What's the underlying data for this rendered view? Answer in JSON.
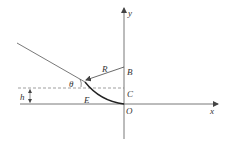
{
  "diagram": {
    "type": "physics-geometry",
    "axes": {
      "x_label": "x",
      "y_label": "y",
      "origin_label": "O"
    },
    "points": {
      "B": "B",
      "C": "C",
      "E": "E",
      "O": "O"
    },
    "labels": {
      "radius": "R",
      "angle": "θ",
      "height": "h"
    },
    "colors": {
      "line": "#555555",
      "curve": "#222222",
      "dashed": "#777777",
      "text": "#333333"
    }
  }
}
